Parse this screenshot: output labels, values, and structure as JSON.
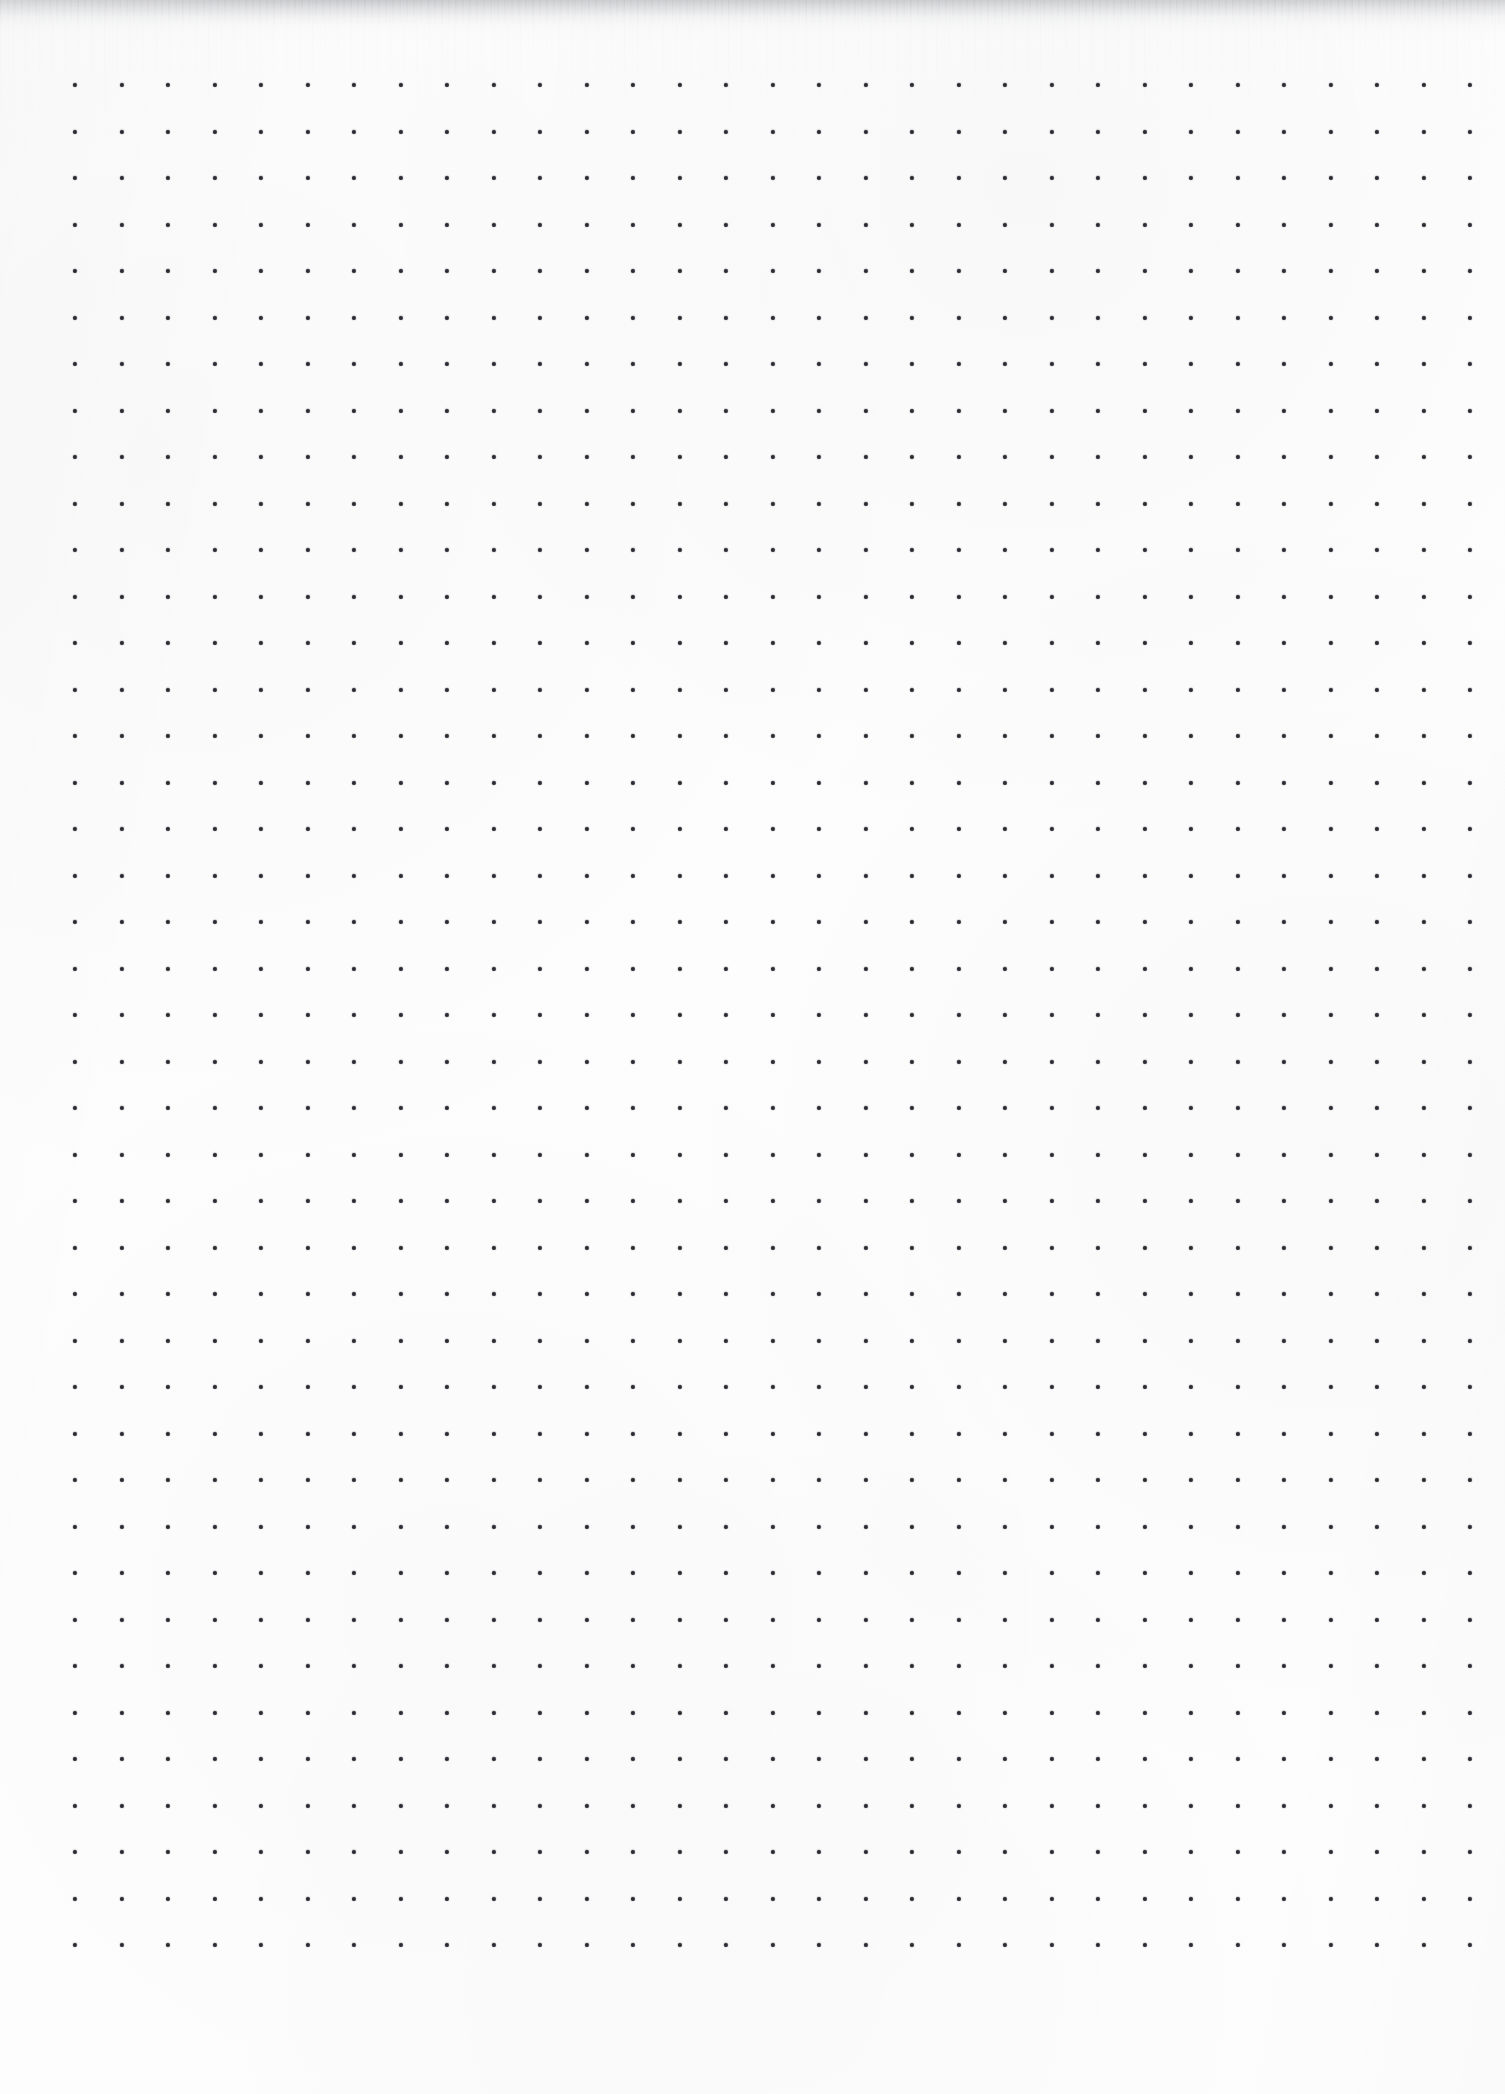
{
  "document": {
    "kind": "dot-grid-paper-scan",
    "title": "Dot Grid Paper",
    "width_px": 1505,
    "height_px": 2094,
    "page_background_color": "#fdfdfd",
    "has_text": false,
    "has_handwriting": false,
    "visible_text": ""
  },
  "grid": {
    "columns": 31,
    "rows": 41,
    "origin_x_px": 75,
    "origin_y_px": 85,
    "spacing_x_px": 46.5,
    "spacing_y_px": 46.5,
    "last_column_x_px": 1470,
    "last_row_y_px": 1945,
    "dot_diameter_px": 4.2,
    "dot_color": "#2b2b33",
    "dot_shape": "circle"
  },
  "artifacts": {
    "top_shadow": {
      "label": "scanner edge shadow",
      "height_px": 40,
      "color": "#9698 9e",
      "color_hex": "#96989e"
    },
    "scan_streaks": {
      "label": "vertical scan streaks",
      "height_px": 150,
      "color_hex": "#8c8e96"
    },
    "paper_texture": {
      "label": "paper mottling",
      "color_hex": "#f6f6f7"
    }
  },
  "margins": {
    "left_px": 75,
    "right_px": 35,
    "top_px": 85,
    "bottom_px": 142
  }
}
